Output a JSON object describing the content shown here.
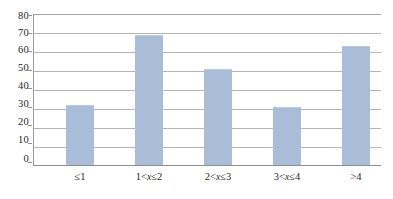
{
  "chart_data": {
    "type": "bar",
    "title": "",
    "subtitle": "",
    "xlabel": "",
    "ylabel": "",
    "categories": [
      "≤1",
      "1<x≤2",
      "2<x≤3",
      "3<x≤4",
      ">4"
    ],
    "values": [
      32,
      69,
      51,
      31,
      63
    ],
    "series": [
      {
        "name": "frequency",
        "values": [
          32,
          69,
          51,
          31,
          63
        ]
      }
    ],
    "ylim": [
      0,
      80
    ],
    "ytick_labels": [
      "0",
      "10",
      "20",
      "30",
      "40",
      "50",
      "60",
      "70",
      "80"
    ],
    "ytick_values": [
      0,
      10,
      20,
      30,
      40,
      50,
      60,
      70,
      80
    ],
    "grid": true,
    "grid_axis": "y",
    "legend": false,
    "legend_position": "none",
    "bar_color": "#aabdd8",
    "gridline_color": "#b4b4b4",
    "axis_color": "#8f8f8f",
    "text_color": "#1f1f1f"
  },
  "axes": {
    "y": {
      "ticks": [
        {
          "label": "80",
          "value": 80
        },
        {
          "label": "70",
          "value": 70
        },
        {
          "label": "60",
          "value": 60
        },
        {
          "label": "50",
          "value": 50
        },
        {
          "label": "40",
          "value": 40
        },
        {
          "label": "30",
          "value": 30
        },
        {
          "label": "20",
          "value": 20
        },
        {
          "label": "10",
          "value": 10
        },
        {
          "label": "0",
          "value": 0
        }
      ]
    },
    "x": {
      "ticks": [
        {
          "label": "≤1",
          "prefix": "≤1",
          "var": "",
          "suffix": ""
        },
        {
          "label": "1<x≤2",
          "prefix": "1<",
          "var": "x",
          "suffix": "≤2"
        },
        {
          "label": "2<x≤3",
          "prefix": "2<",
          "var": "x",
          "suffix": "≤3"
        },
        {
          "label": "3<x≤4",
          "prefix": "3<",
          "var": "x",
          "suffix": "≤4"
        },
        {
          "label": ">4",
          "prefix": ">4",
          "var": "",
          "suffix": ""
        }
      ]
    }
  }
}
